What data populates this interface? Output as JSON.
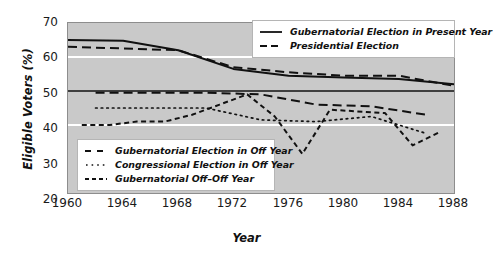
{
  "chart_data": {
    "type": "line",
    "title": "",
    "xlabel": "Year",
    "ylabel": "Eligible Voters (%)",
    "xlim": [
      1960,
      1988
    ],
    "ylim": [
      20,
      70
    ],
    "xticks": [
      1960,
      1964,
      1968,
      1972,
      1976,
      1980,
      1984,
      1988
    ],
    "yticks": [
      20,
      30,
      40,
      50,
      60,
      70
    ],
    "grid": "horizontal white gridlines at 40 and 60; solid black reference line at 50",
    "legend_position": "top-right and lower-left inside plot",
    "plot_background": "#c9c9c9",
    "series": [
      {
        "name": "Gubernatorial Election in Present Year",
        "style": "solid",
        "legend": "top",
        "x": [
          1960,
          1964,
          1968,
          1972,
          1976,
          1980,
          1984,
          1988
        ],
        "values": [
          65.0,
          64.8,
          62.0,
          56.5,
          54.5,
          54.0,
          53.5,
          52.0
        ]
      },
      {
        "name": "Presidential Election",
        "style": "dashed",
        "legend": "top",
        "x": [
          1960,
          1964,
          1968,
          1972,
          1976,
          1980,
          1984,
          1988
        ],
        "values": [
          63.0,
          62.5,
          62.0,
          57.0,
          55.5,
          54.5,
          54.5,
          51.5
        ]
      },
      {
        "name": "Gubernatorial Election in Off Year",
        "style": "dashed",
        "legend": "bottom",
        "x": [
          1962,
          1966,
          1970,
          1974,
          1978,
          1982,
          1986
        ],
        "values": [
          49.5,
          49.5,
          49.5,
          49.0,
          46.0,
          45.5,
          43.0
        ]
      },
      {
        "name": "Congressional Election in Off Year",
        "style": "dotted",
        "legend": "bottom",
        "x": [
          1962,
          1966,
          1970,
          1974,
          1978,
          1982,
          1986
        ],
        "values": [
          45.0,
          45.0,
          45.0,
          41.5,
          41.0,
          42.5,
          37.5
        ]
      },
      {
        "name": "Gubernatorial Off-Off Year",
        "style": "dashed-fine",
        "legend": "bottom",
        "x": [
          1961,
          1963,
          1965,
          1967,
          1969,
          1971,
          1973,
          1975,
          1977,
          1979,
          1981,
          1983,
          1985,
          1987
        ],
        "values": [
          40.0,
          40.0,
          41.0,
          41.0,
          43.0,
          46.0,
          49.0,
          42.5,
          31.5,
          44.5,
          44.0,
          43.5,
          34.0,
          38.0
        ]
      }
    ]
  },
  "axes": {
    "ylabel": "Eligible Voters (%)",
    "xlabel": "Year",
    "yticks": [
      "70",
      "60",
      "50",
      "40",
      "30",
      "20"
    ],
    "xticks": [
      "1960",
      "1964",
      "1968",
      "1972",
      "1976",
      "1980",
      "1984",
      "1988"
    ]
  },
  "legend_top": {
    "items": [
      {
        "label": "Gubernatorial Election in Present Year",
        "style": "solid"
      },
      {
        "label": "Presidential Election",
        "style": "dashed"
      }
    ]
  },
  "legend_bottom": {
    "items": [
      {
        "label": "Gubernatorial Election in Off Year",
        "style": "dashed"
      },
      {
        "label": "Congressional Election in Off Year",
        "style": "dotted"
      },
      {
        "label": "Gubernatorial Off–Off Year",
        "style": "dashed-fine"
      }
    ]
  }
}
